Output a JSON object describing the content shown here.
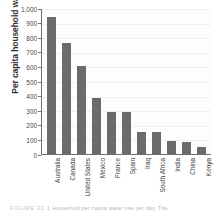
{
  "chart_data": {
    "type": "bar",
    "title": "",
    "xlabel": "",
    "ylabel": "Per capita household water use (L)",
    "ylim": [
      0,
      1000
    ],
    "ytick_labels": [
      "1,000",
      "900",
      "800",
      "700",
      "600",
      "500",
      "400",
      "300",
      "200",
      "100",
      "0"
    ],
    "ytick_values": [
      1000,
      900,
      800,
      700,
      600,
      500,
      400,
      300,
      200,
      100,
      0
    ],
    "grid": true,
    "legend": "none",
    "bar_color": "#6b6b6b",
    "plot_background": "#fdfdfd",
    "axis_color": "#6f6f6f",
    "categories": [
      "Australia",
      "Canada",
      "United States",
      "Mexico",
      "France",
      "Spain",
      "Iraq",
      "South Africa",
      "India",
      "China",
      "Kenya"
    ],
    "values": [
      940,
      760,
      600,
      385,
      285,
      285,
      150,
      150,
      90,
      80,
      50
    ]
  },
  "caption": {
    "number": "FIGURE 22-1",
    "text": "Household per capita water use per day. The"
  }
}
